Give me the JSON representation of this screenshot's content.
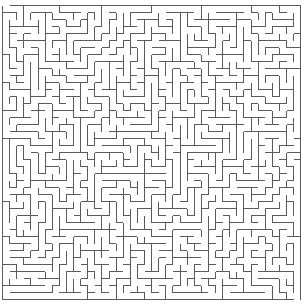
{
  "maze": {
    "cols": 42,
    "rows": 42,
    "origin_x": 2.5,
    "origin_y": 5.5,
    "cell_w": 7.1,
    "cell_h": 7.0,
    "wall_color": "#5a5a5a",
    "background": "#ffffff",
    "seed": 1337
  }
}
